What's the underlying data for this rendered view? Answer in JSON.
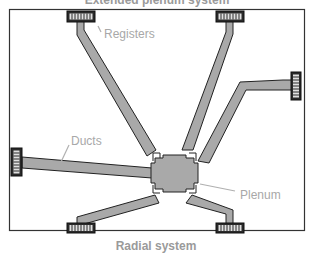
{
  "diagram": {
    "top_title": "Extended plenum system",
    "bottom_title": "Radial system",
    "labels": {
      "registers": "Registers",
      "ducts": "Ducts",
      "plenum": "Plenum"
    },
    "colors": {
      "duct_fill": "#a9a9a9",
      "outline": "#222222",
      "label_text": "#a8a8a8",
      "frame": "#333333",
      "background": "#ffffff"
    },
    "components": {
      "plenum_count": 1,
      "register_count": 6,
      "duct_count": 6
    }
  }
}
